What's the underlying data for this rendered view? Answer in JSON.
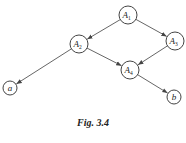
{
  "figure": {
    "caption": "Fig. 3.4",
    "nodes": [
      {
        "id": "A1",
        "label": "A",
        "sub": "1",
        "cx": 128,
        "cy": 15,
        "r": 9
      },
      {
        "id": "A2",
        "label": "A",
        "sub": "2",
        "cx": 79,
        "cy": 44,
        "r": 9
      },
      {
        "id": "A3",
        "label": "A",
        "sub": "3",
        "cx": 175,
        "cy": 41,
        "r": 9
      },
      {
        "id": "A4",
        "label": "A",
        "sub": "4",
        "cx": 130,
        "cy": 70,
        "r": 9
      },
      {
        "id": "a",
        "label": "a",
        "sub": "",
        "cx": 10,
        "cy": 88,
        "r": 7
      },
      {
        "id": "b",
        "label": "b",
        "sub": "",
        "cx": 174,
        "cy": 97,
        "r": 7
      }
    ],
    "edges": [
      {
        "from": "A1",
        "to": "A2"
      },
      {
        "from": "A1",
        "to": "A3"
      },
      {
        "from": "A2",
        "to": "a"
      },
      {
        "from": "A2",
        "to": "A4"
      },
      {
        "from": "A3",
        "to": "A4"
      },
      {
        "from": "A4",
        "to": "b"
      }
    ]
  }
}
